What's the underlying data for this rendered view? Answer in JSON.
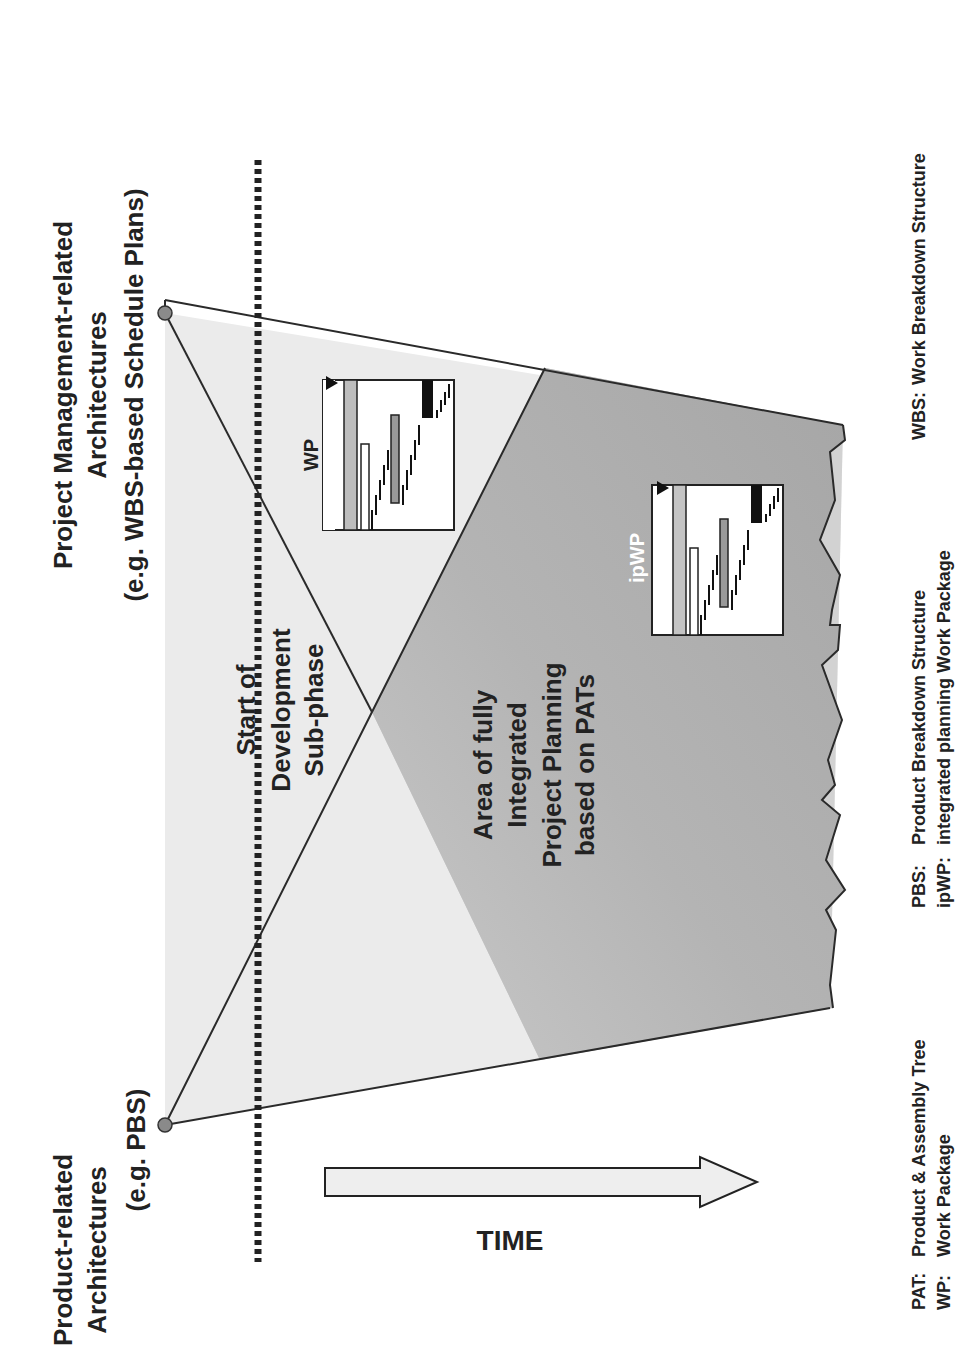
{
  "diagram": {
    "orientation": "rotated-90-ccw",
    "left_source": {
      "line1": "Product-related",
      "line2": "Architectures",
      "line3": "(e.g. PBS)"
    },
    "right_source": {
      "line1": "Project Management-related",
      "line2": "Architectures",
      "line3": "(e.g. WBS-based Schedule Plans)"
    },
    "milestone": {
      "line1": "Start of",
      "line2": "Development",
      "line3": "Sub-phase"
    },
    "integrated_area": {
      "line1": "Area of fully",
      "line2": "Integrated",
      "line3": "Project Planning",
      "line4": "based on PATs"
    },
    "wp_box_label": "WP",
    "ipwp_box_label": "ipWP",
    "time_label": "TIME",
    "colors": {
      "light_region": "#e9e9e9",
      "mid_region": "#d4d4d4",
      "dark_region": "#a9a9a9",
      "outline": "#2a2a2a",
      "node": "#8a8a8a"
    }
  },
  "legend": {
    "col1": [
      {
        "abbr": "PAT:",
        "text": "Product & Assembly Tree"
      },
      {
        "abbr": "WP:",
        "text": "Work Package"
      }
    ],
    "col2": [
      {
        "abbr": "PBS:",
        "text": "Product Breakdown Structure"
      },
      {
        "abbr": "ipWP:",
        "text": "integrated planning Work Package"
      }
    ],
    "col3": [
      {
        "abbr": "WBS:",
        "text": "Work Breakdown Structure"
      }
    ]
  }
}
